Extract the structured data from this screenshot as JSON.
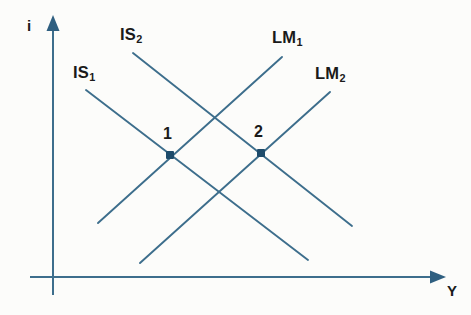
{
  "figure": {
    "background_color": "#fcfcfa",
    "curve_color": "#3d6e8c",
    "axis_color": "#3d6e8c",
    "point_color": "#1d4b6b",
    "text_color": "#1a1a1a",
    "width": 471,
    "height": 315
  },
  "axes": {
    "vertical": {
      "label": "i",
      "name": "interest-rate-axis",
      "x": 53,
      "top": 22,
      "bottom": 295,
      "arrow": "up"
    },
    "horizontal": {
      "label": "Y",
      "name": "output-axis",
      "y": 277,
      "left": 30,
      "right": 443,
      "arrow": "right"
    }
  },
  "curves": [
    {
      "id": "is1",
      "label": "IS",
      "subscript": "1",
      "kind": "IS",
      "slope": "downward",
      "x1": 86,
      "y1": 90,
      "x2": 308,
      "y2": 260
    },
    {
      "id": "is2",
      "label": "IS",
      "subscript": "2",
      "kind": "IS",
      "slope": "downward",
      "x1": 133,
      "y1": 53,
      "x2": 352,
      "y2": 226
    },
    {
      "id": "lm1",
      "label": "LM",
      "subscript": "1",
      "kind": "LM",
      "slope": "upward",
      "x1": 98,
      "y1": 223,
      "x2": 282,
      "y2": 57
    },
    {
      "id": "lm2",
      "label": "LM",
      "subscript": "2",
      "kind": "LM",
      "slope": "upward",
      "x1": 140,
      "y1": 263,
      "x2": 330,
      "y2": 92
    }
  ],
  "equilibrium_points": [
    {
      "id": "point-1",
      "label": "1",
      "x": 170,
      "y": 155,
      "intersection_of": [
        "is1",
        "lm1"
      ]
    },
    {
      "id": "point-2",
      "label": "2",
      "x": 261,
      "y": 153,
      "intersection_of": [
        "is2",
        "lm2"
      ]
    }
  ]
}
